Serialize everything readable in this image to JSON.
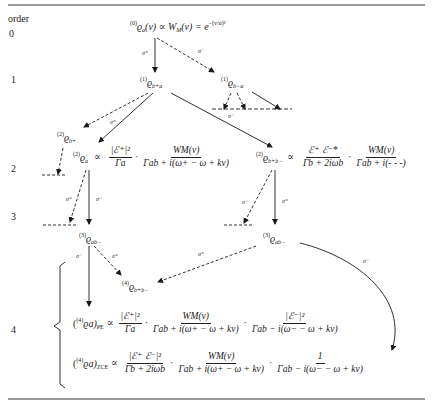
{
  "header": {
    "column_label": "order"
  },
  "orders": [
    "0",
    "1",
    "2",
    "3",
    "4"
  ],
  "nodes": {
    "n0": {
      "pre": "(0)",
      "sym": "ϱ",
      "sub": "a",
      "rest": "(v) ∝ W",
      "rest_sub": "M",
      "rest2": "(v) = e",
      "exp": "−(v/u)²"
    },
    "n1_left": {
      "pre": "(1)",
      "sym": "ϱ",
      "sub": "b+a"
    },
    "n1_right": {
      "pre": "(1)",
      "sym": "ϱ",
      "sub": "b−a"
    },
    "n2_bplus": {
      "pre": "(2)",
      "sym": "ϱ",
      "sub": "b+"
    },
    "n2_a": {
      "pre": "(2)",
      "sym": "ϱ",
      "sub": "a"
    },
    "n2_bb": {
      "pre": "(2)",
      "sym": "ϱ",
      "sub": "b+b−"
    },
    "n3_left": {
      "pre": "(3)",
      "sym": "ϱ",
      "sub": "ab−"
    },
    "n3_right": {
      "pre": "(3)",
      "sym": "ϱ",
      "sub": "ab−"
    },
    "n4_bb": {
      "pre": "(4)",
      "sym": "ϱ",
      "sub": "b+b−"
    }
  },
  "equations": {
    "eq2a": {
      "prop": "∝",
      "f1_num": "|ℰ⁺|²",
      "f1_den": "Γa",
      "f2_num": "WM(v)",
      "f2_den": "Γab + i(ω+ − ω + kv)"
    },
    "eq2bb": {
      "prop": "∝",
      "f1_num": "ℰ⁺ ℰ⁻*",
      "f1_den": "Γb + 2iωb",
      "f2_num": "WM(v)",
      "f2_den": "Γab + i(- - -)"
    },
    "eq4pe": {
      "lhs_pre": "(4)",
      "lhs": "ϱa)",
      "lhs_sub": "PE",
      "prop": "∝",
      "f1_num": "|ℰ⁺|²",
      "f1_den": "Γa",
      "f2_num": "WM(v)",
      "f2_den": "Γab + i(ω+ − ω + kv)",
      "f3_num": "|ℰ⁻|²",
      "f3_den": "Γab − i(ω− − ω + kv)"
    },
    "eq4zce": {
      "lhs_pre": "(4)",
      "lhs": "ϱa)",
      "lhs_sub": "ZCE",
      "prop": "∝",
      "f1_num": "|ℰ⁺ ℰ⁻|²",
      "f1_den": "Γb + 2iωb",
      "f2_num": "WM(v)",
      "f2_den": "Γab + i(ω+ − ω + kv)",
      "f3_num": "1",
      "f3_den": "Γab − i(ω− − ω + kv)"
    }
  },
  "edge_labels": {
    "s0_left": "σ⁺",
    "s0_right": "σ⁻",
    "s1_left": "σ⁺",
    "s1_right_bottom": "σ⁻",
    "s2_left_dashed": "σ⁺",
    "s2_left_solid": "σ⁻",
    "s2_right_dashed": "σ⁻",
    "s2_right_solid": "σ⁺",
    "s3_left_solid": "σ⁻",
    "s3_left_dashed": "σ⁺",
    "s3_right_dashed": "σ⁺",
    "s3_right_curve": "σ⁻"
  },
  "colors": {
    "ink": "#1a1a1a",
    "background": "#ffffff"
  }
}
